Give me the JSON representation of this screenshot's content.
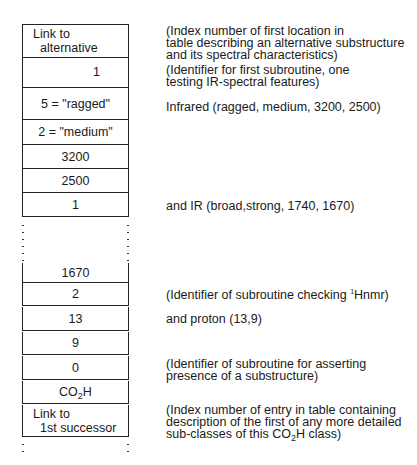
{
  "table": {
    "rows_top": [
      {
        "line1": "Link to",
        "line2": "alternative"
      },
      {
        "value": "1"
      },
      {
        "value": "5 = \"ragged\""
      },
      {
        "value": "2 = \"medium\""
      },
      {
        "value": "3200"
      },
      {
        "value": "2500"
      },
      {
        "value": "1"
      }
    ],
    "rows_bottom": [
      {
        "value": "1670"
      },
      {
        "value": "2"
      },
      {
        "value": "13"
      },
      {
        "value": "9"
      },
      {
        "value": "0"
      },
      {
        "value_main": "CO",
        "value_sub": "2",
        "value_tail": "H"
      },
      {
        "line1": "Link to",
        "line2": "1st successor"
      }
    ]
  },
  "annotations": {
    "link_alternative": {
      "line1": "(Index number of first location in",
      "line2": "table describing an alternative substructure",
      "line3": "and its spectral characteristics)"
    },
    "first_subroutine": {
      "line1": "(Identifier for first subroutine, one",
      "line2": "testing IR-spectral features)"
    },
    "infrared": "Infrared (ragged, medium, 3200, 2500)",
    "and_ir": "and IR (broad,strong, 1740, 1670)",
    "hnmr": {
      "pre": "(Identifier of subroutine checking ",
      "sup": "1",
      "post": "Hnmr)"
    },
    "proton": "and proton (13,9)",
    "asserting": {
      "line1": "(Identifier of subroutine for asserting",
      "line2": "presence of a substructure)"
    },
    "successor": {
      "line1": "(Index number of entry in table containing",
      "line2": "description of the first of any more detailed",
      "line3_pre": "sub-classes of this CO",
      "line3_sub": "2",
      "line3_post": "H class)"
    }
  }
}
